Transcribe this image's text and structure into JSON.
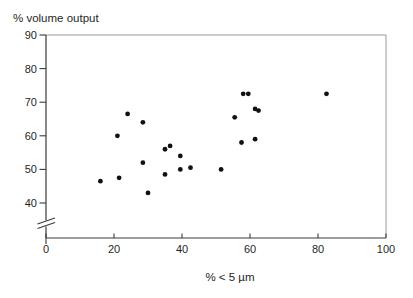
{
  "figure": {
    "title": "% volume output",
    "x_axis_label": "% < 5 µm"
  },
  "chart_data": {
    "type": "scatter",
    "title": "% volume output",
    "xlabel": "% < 5 µm",
    "ylabel": "% volume output",
    "xlim": [
      0,
      100
    ],
    "ylim": [
      40,
      90
    ],
    "x_ticks": [
      0,
      20,
      40,
      60,
      80,
      100
    ],
    "y_ticks": [
      90,
      80,
      70,
      60,
      50,
      40
    ],
    "axis_break": "y-axis broken below 40 (double-slash break mark above origin)",
    "grid": false,
    "legend": "none",
    "marker": {
      "shape": "circle",
      "color": "#111111",
      "radius_px": 2.4
    },
    "points": [
      {
        "x": 16,
        "y": 46.5
      },
      {
        "x": 21.5,
        "y": 47.5
      },
      {
        "x": 21,
        "y": 60
      },
      {
        "x": 24,
        "y": 66.5
      },
      {
        "x": 28.5,
        "y": 64
      },
      {
        "x": 28.5,
        "y": 52
      },
      {
        "x": 30,
        "y": 43
      },
      {
        "x": 35,
        "y": 56
      },
      {
        "x": 36.5,
        "y": 57
      },
      {
        "x": 35,
        "y": 48.5
      },
      {
        "x": 39.5,
        "y": 54
      },
      {
        "x": 39.5,
        "y": 50
      },
      {
        "x": 42.5,
        "y": 50.5
      },
      {
        "x": 51.5,
        "y": 50
      },
      {
        "x": 55.5,
        "y": 65.5
      },
      {
        "x": 57.5,
        "y": 58
      },
      {
        "x": 58,
        "y": 72.5
      },
      {
        "x": 59.5,
        "y": 72.5
      },
      {
        "x": 61.5,
        "y": 68
      },
      {
        "x": 62.5,
        "y": 67.5
      },
      {
        "x": 61.5,
        "y": 59
      },
      {
        "x": 82.5,
        "y": 72.5
      }
    ]
  },
  "colors": {
    "marker": "#111111",
    "axis_main": "#3a3a3a",
    "frame_border": "#9a9a9a",
    "text": "#1f1f1f",
    "background": "#ffffff"
  }
}
